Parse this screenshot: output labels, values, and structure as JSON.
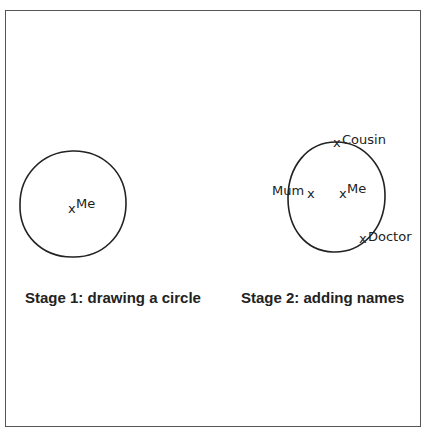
{
  "diagram": {
    "stage1": {
      "caption": "Stage 1: drawing a circle",
      "center_label": "Me",
      "marker": "x"
    },
    "stage2": {
      "caption": "Stage 2: adding names",
      "center_label": "Me",
      "marker": "x",
      "names": [
        {
          "label": "Cousin",
          "position": "on circle, top"
        },
        {
          "label": "Mum",
          "position": "inside circle, left"
        },
        {
          "label": "Doctor",
          "position": "on circle, bottom-right"
        }
      ]
    },
    "colors": {
      "line": "#222222",
      "frame": "#555555",
      "background": "#ffffff"
    }
  }
}
